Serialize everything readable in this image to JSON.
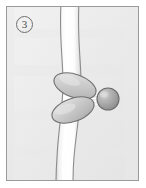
{
  "figure": {
    "panel_number": "3",
    "caption_text": "",
    "background_color": "#eeeeee",
    "border_color": "#9a9a9a",
    "frame": {
      "x": 6,
      "y": 6,
      "width": 133,
      "height": 175
    }
  },
  "elements": {
    "strand": {
      "name": "vertical-strand",
      "fill_color": "#fbfbfb",
      "outline_color": "#8f8f8f",
      "highlight_color": "#ffffff"
    },
    "upper_lobe": {
      "name": "upper-oval-body",
      "fill_color": "#c9c9c9",
      "outline_color": "#6f6f6f",
      "highlight_color": "#e3e3e3",
      "rotation_deg": 20
    },
    "lower_lobe": {
      "name": "lower-oval-body",
      "fill_color": "#c9c9c9",
      "outline_color": "#6f6f6f",
      "highlight_color": "#e3e3e3",
      "rotation_deg": -20
    },
    "sphere": {
      "name": "attached-sphere",
      "fill_color": "#a8a8a8",
      "outline_color": "#6a6a6a",
      "highlight_color": "#d6d6d6",
      "radius": 11
    },
    "spokes": {
      "name": "radiating-fibers",
      "color": "#ffffff",
      "count": 5
    }
  }
}
